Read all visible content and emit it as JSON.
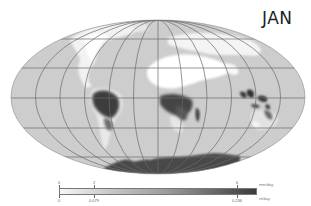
{
  "title": "JAN",
  "map": {
    "projection": "Mollweide",
    "variable": "precipitation",
    "ocean_fill": "#cfcfcf",
    "dry_fill": "#ffffff",
    "wet_fill": "#3a3a3a",
    "gridline_color": "#6a6a6a",
    "parallels": [
      "60N",
      "30N",
      "0",
      "30S",
      "60S"
    ],
    "meridian_spacing_deg": 30
  },
  "colorbar": {
    "colors": [
      "#f6f6f6",
      "#3c3c3c"
    ],
    "top_ticks": [
      {
        "label": "0",
        "pos": 0
      },
      {
        "label": "2",
        "pos": 0.18
      },
      {
        "label": "6",
        "pos": 0.9
      }
    ],
    "bottom_ticks": [
      {
        "label": "0",
        "pos": 0
      },
      {
        "label": "0.079",
        "pos": 0.18
      },
      {
        "label": "0.236",
        "pos": 0.9
      }
    ],
    "top_unit": "mm/day",
    "bottom_unit": "in/day"
  }
}
